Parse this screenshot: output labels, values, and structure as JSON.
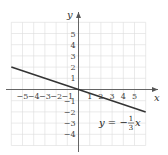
{
  "chart_data": {
    "type": "line",
    "title": "",
    "xlabel": "x",
    "ylabel": "y",
    "xlim": [
      -6,
      6
    ],
    "ylim": [
      -5,
      6
    ],
    "grid": true,
    "x_ticks": [
      "-5",
      "-4",
      "-3",
      "-2",
      "-1",
      "1",
      "2",
      "3",
      "4",
      "5"
    ],
    "y_ticks": [
      "5",
      "4",
      "3",
      "2",
      "1",
      "-1",
      "-2",
      "-3",
      "-4"
    ],
    "series": [
      {
        "name": "y = -1/3 x",
        "x": [
          -6,
          6
        ],
        "y": [
          2,
          -2
        ]
      }
    ],
    "annotation": {
      "text_prefix": "y = −",
      "frac_num": "1",
      "frac_den": "3",
      "text_suffix": "x",
      "position": [
        2.5,
        -3
      ]
    }
  },
  "colors": {
    "grid": "#dcdcdc",
    "axis": "#555555",
    "line": "#333333"
  }
}
